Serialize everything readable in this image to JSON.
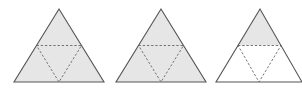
{
  "diagram": {
    "colors": {
      "shaded": "#e6e6e6",
      "unshaded": "#ffffff",
      "outline": "#555555",
      "dashed": "#666666"
    },
    "figures": [
      {
        "name": "triangle-1",
        "shaded_parts": [
          "top",
          "left",
          "center",
          "right"
        ]
      },
      {
        "name": "triangle-2",
        "shaded_parts": [
          "top",
          "left",
          "center",
          "right"
        ]
      },
      {
        "name": "triangle-3",
        "shaded_parts": [
          "top"
        ]
      }
    ]
  }
}
